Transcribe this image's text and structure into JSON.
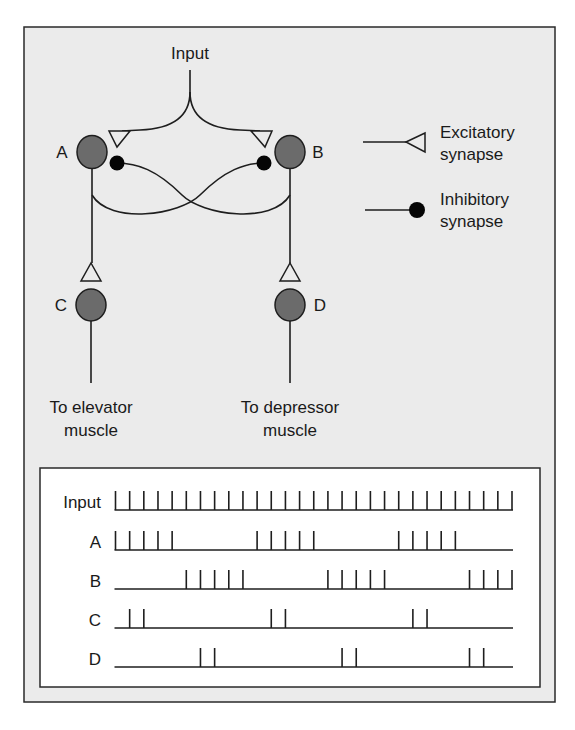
{
  "colors": {
    "page_bg": "#ffffff",
    "panel_bg": "#ebebeb",
    "panel_border": "#2a2a2a",
    "inner_bg": "#ffffff",
    "neuron_fill": "#6b6b6b",
    "stroke": "#1e1e1e",
    "dot_fill": "#050505",
    "triangle_fill": "#ebebeb"
  },
  "circuit": {
    "input_label": "Input",
    "neurons": [
      {
        "id": "A",
        "label": "A"
      },
      {
        "id": "B",
        "label": "B"
      },
      {
        "id": "C",
        "label": "C"
      },
      {
        "id": "D",
        "label": "D"
      }
    ],
    "outputs": {
      "left_line1": "To elevator",
      "left_line2": "muscle",
      "right_line1": "To depressor",
      "right_line2": "muscle"
    },
    "connections": [
      {
        "from": "Input",
        "to": "A",
        "type": "excitatory"
      },
      {
        "from": "Input",
        "to": "B",
        "type": "excitatory"
      },
      {
        "from": "A",
        "to": "B",
        "type": "inhibitory"
      },
      {
        "from": "B",
        "to": "A",
        "type": "inhibitory"
      },
      {
        "from": "A",
        "to": "C",
        "type": "excitatory"
      },
      {
        "from": "B",
        "to": "D",
        "type": "excitatory"
      },
      {
        "from": "C",
        "to": "elevator muscle",
        "type": "output"
      },
      {
        "from": "D",
        "to": "depressor muscle",
        "type": "output"
      }
    ]
  },
  "legend": {
    "excitatory_line1": "Excitatory",
    "excitatory_line2": "synapse",
    "inhibitory_line1": "Inhibitory",
    "inhibitory_line2": "synapse"
  },
  "spike_trains": {
    "total_time_slots": 29,
    "rows": [
      {
        "label": "Input",
        "spikes": [
          0,
          1,
          2,
          3,
          4,
          5,
          6,
          7,
          8,
          9,
          10,
          11,
          12,
          13,
          14,
          15,
          16,
          17,
          18,
          19,
          20,
          21,
          22,
          23,
          24,
          25,
          26,
          27,
          28
        ]
      },
      {
        "label": "A",
        "spikes": [
          0,
          1,
          2,
          3,
          4,
          10,
          11,
          12,
          13,
          14,
          20,
          21,
          22,
          23,
          24
        ]
      },
      {
        "label": "B",
        "spikes": [
          5,
          6,
          7,
          8,
          9,
          15,
          16,
          17,
          18,
          19,
          25,
          26,
          27,
          28
        ]
      },
      {
        "label": "C",
        "spikes": [
          1,
          2,
          11,
          12,
          21,
          22
        ]
      },
      {
        "label": "D",
        "spikes": [
          6,
          7,
          16,
          17,
          25,
          26
        ]
      }
    ]
  }
}
